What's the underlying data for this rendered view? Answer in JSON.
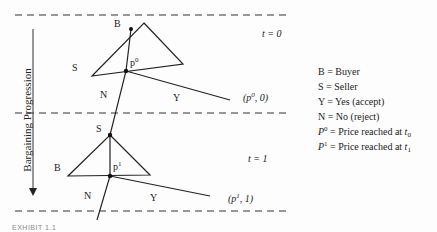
{
  "diagram": {
    "axis_label": "Bargaining Progression",
    "stages": [
      {
        "time_label": "t = 0",
        "top_node": "B",
        "side_node": "S",
        "price_label": "p",
        "price_sup": "0",
        "reject": "N",
        "accept": "Y",
        "payoff_prefix": "(p",
        "payoff_sup": "0",
        "payoff_suffix": ", 0)"
      },
      {
        "time_label": "t = 1",
        "top_node": "S",
        "side_node": "B",
        "price_label": "p",
        "price_sup": "1",
        "reject": "N",
        "accept": "Y",
        "payoff_prefix": "(p",
        "payoff_sup": "1",
        "payoff_suffix": ", 1)"
      }
    ]
  },
  "legend": {
    "items": [
      {
        "text": "B = Buyer"
      },
      {
        "text": "S = Seller"
      },
      {
        "text": "Y = Yes (accept)"
      },
      {
        "text": "N = No (reject)"
      },
      {
        "sym": "P",
        "sup": "0",
        "text": " = Price reached at ",
        "tsym": "t",
        "tsub": "0"
      },
      {
        "sym": "P",
        "sup": "1",
        "text": " = Price reached at ",
        "tsym": "t",
        "tsub": "1"
      }
    ]
  },
  "caption": "EXHIBIT 1.1"
}
